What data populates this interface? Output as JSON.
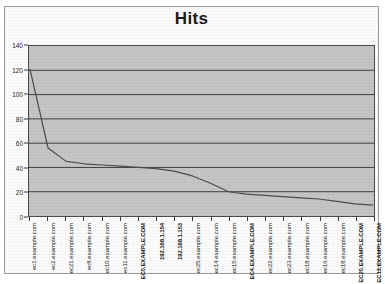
{
  "chart_data": {
    "type": "line",
    "title": "Hits",
    "xlabel": "",
    "ylabel": "",
    "ylim": [
      0,
      140
    ],
    "ytick_step": 20,
    "yticks": [
      0,
      20,
      40,
      60,
      80,
      100,
      120,
      140
    ],
    "grid": true,
    "legend": false,
    "plot_background": "#c6c6c6",
    "line_color": "#4d4d4d",
    "categories": [
      "ec1.example.com",
      "ec2.example.com",
      "ec21.example.com",
      "ec8.example.com",
      "ec10.example.com",
      "ec11.example.com",
      "EC0.EXAMPLE.COM",
      "192.168.1.154",
      "192.168.1.153",
      "ec25.example.com",
      "ec14.example.com",
      "ec15.example.com",
      "EC4.EXAMPLE.COM",
      "ec22.example.com",
      "ec23.example.com",
      "ec18.example.com",
      "ec16.example.com",
      "ec18.example.com",
      "EC20.EXAMPLE.COM",
      "EC13.EXAMPLE.COM"
    ],
    "values": [
      121,
      56,
      45,
      43,
      42,
      41,
      40,
      39,
      37,
      33,
      27,
      20,
      18,
      17,
      16,
      15,
      14,
      12,
      10,
      9
    ],
    "series": [
      {
        "name": "Hits",
        "values": [
          121,
          56,
          45,
          43,
          42,
          41,
          40,
          39,
          37,
          33,
          27,
          20,
          18,
          17,
          16,
          15,
          14,
          12,
          10,
          9
        ]
      }
    ]
  }
}
